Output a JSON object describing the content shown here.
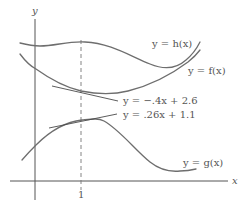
{
  "diagram": {
    "axes": {
      "x_label": "x",
      "y_label": "y",
      "tick_label": "1"
    },
    "curves": [
      {
        "id": "h",
        "label": "y = h(x)"
      },
      {
        "id": "f",
        "label": "y = f(x)"
      },
      {
        "id": "g",
        "label": "y = g(x)"
      }
    ],
    "tangent_lines": [
      {
        "of": "f",
        "at_x": 1,
        "label": "y = −.4x + 2.6"
      },
      {
        "of": "g",
        "at_x": 1,
        "label": "y = .26x + 1.1"
      }
    ],
    "colors": {
      "curve": "#6e6e6e",
      "axis": "#555555",
      "text": "#555555",
      "background": "#ffffff"
    }
  }
}
